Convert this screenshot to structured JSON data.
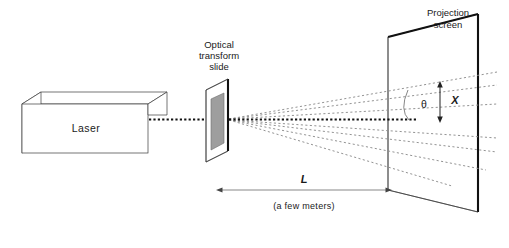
{
  "figure": {
    "background_color": "#ffffff",
    "width": 509,
    "height": 248
  },
  "labels": {
    "laser": "Laser",
    "slide_line1": "Optical",
    "slide_line2": "transform",
    "slide_line3": "slide",
    "screen_line1": "Projection",
    "screen_line2": "screen",
    "theta": "θ",
    "x_dimension": "X",
    "l_dimension": "L",
    "caption": "(a few meters)"
  },
  "colors": {
    "ink": "#1a1a1a",
    "outline": "#3a3a3a",
    "beam": "#111111",
    "ray": "#8d8d8d",
    "slide_fill": "#9e9e9e",
    "dimension": "#555555",
    "screen_edge": "#111111"
  },
  "components": {
    "laser_box": {
      "name": "laser",
      "style": "3d-rectangular-box",
      "label": "Laser"
    },
    "optical_slide": {
      "name": "optical transform slide",
      "style": "tilted-panel-with-grey-aperture"
    },
    "projection_screen": {
      "name": "projection screen",
      "style": "tilted-parallelogram-panel"
    },
    "incident_beam": {
      "name": "laser beam",
      "style": "heavy-dotted-horizontal"
    },
    "diffracted_rays": {
      "name": "diffracted ray fan",
      "style": "light-dotted",
      "count_above_axis": 3,
      "count_below_axis": 4
    }
  },
  "annotations": {
    "theta_meaning": "diffraction angle measured from the optical axis at the screen",
    "x_meaning": "height of the diffraction spot above the optical axis on the screen",
    "l_meaning": "distance from slide to projection screen"
  }
}
